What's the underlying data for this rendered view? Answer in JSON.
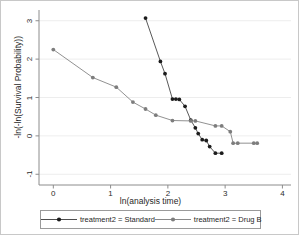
{
  "chart_data": {
    "type": "line",
    "title": "",
    "xlabel": "ln(analysis time)",
    "ylabel": "-ln(-ln(Survival Probability))",
    "xlim": [
      -0.25,
      4.15
    ],
    "ylim": [
      -1.28,
      3.28
    ],
    "xticks": [
      "0",
      "1",
      "2",
      "3",
      "4"
    ],
    "xtick_values": [
      0,
      1,
      2,
      3,
      4
    ],
    "yticks": [
      "-1",
      "0",
      "1",
      "2",
      "3"
    ],
    "ytick_values": [
      -1,
      0,
      1,
      2,
      3
    ],
    "grid": "horizontal",
    "legend_position": "bottom",
    "series": [
      {
        "name": "treatment2 = Standard",
        "color": "#3a3a3a",
        "marker": "circle-filled-dark",
        "x": [
          1.61,
          1.87,
          1.95,
          2.08,
          2.14,
          2.2,
          2.3,
          2.4,
          2.48,
          2.53,
          2.6,
          2.67,
          2.73,
          2.83,
          2.94
        ],
        "y": [
          3.07,
          1.94,
          1.62,
          0.96,
          0.96,
          0.95,
          0.77,
          0.41,
          0.21,
          0.06,
          -0.1,
          -0.12,
          -0.28,
          -0.45,
          -0.45
        ]
      },
      {
        "name": "treatment2 = Drug B",
        "color": "#7d7d7d",
        "marker": "circle-filled-gray",
        "x": [
          0.0,
          0.69,
          1.1,
          1.39,
          1.61,
          1.79,
          2.08,
          2.4,
          2.48,
          2.83,
          2.94,
          3.09,
          3.14,
          3.22,
          3.5,
          3.56
        ],
        "y": [
          2.25,
          1.52,
          1.27,
          0.88,
          0.7,
          0.54,
          0.4,
          0.39,
          0.39,
          0.26,
          0.26,
          0.11,
          -0.19,
          -0.19,
          -0.19,
          -0.19
        ]
      }
    ]
  },
  "legend": {
    "items": [
      {
        "label": "treatment2 = Standard",
        "color": "#3a3a3a"
      },
      {
        "label": "treatment2 = Drug B",
        "color": "#7d7d7d"
      }
    ]
  }
}
